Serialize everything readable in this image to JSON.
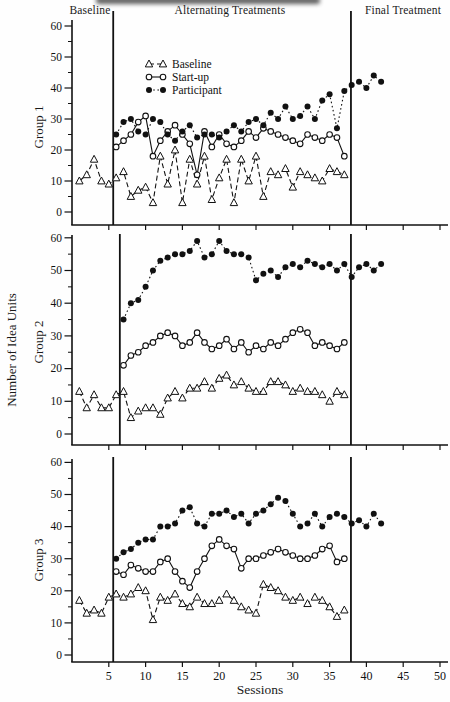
{
  "figure": {
    "phase_labels": {
      "baseline": "Baseline",
      "alternating": "Alternating Treatments",
      "final": "Final Treatment"
    },
    "ylabel": "Number of Idea Units",
    "xlabel": "Sessions",
    "legend": [
      {
        "key": "baseline",
        "label": "Baseline"
      },
      {
        "key": "startup",
        "label": "Start-up"
      },
      {
        "key": "participant",
        "label": "Participant"
      }
    ],
    "colors": {
      "ink": "#111111",
      "paper": "#fefefe"
    }
  },
  "chart_data": [
    {
      "type": "line",
      "title": "Group 1",
      "ylabel": "Group 1",
      "ylim": [
        0,
        60
      ],
      "yticks": [
        0,
        10,
        20,
        30,
        40,
        50,
        60
      ],
      "xlim": [
        0,
        50
      ],
      "xticks": [
        5,
        10,
        15,
        20,
        25,
        30,
        35,
        40,
        45,
        50
      ],
      "grid": false,
      "legend_position": "upper-left-inside",
      "phase_lines": [
        5.6,
        37.9
      ],
      "series": [
        {
          "name": "Baseline",
          "key": "baseline",
          "marker": "open-triangle",
          "line": "dashed",
          "start_session": 1,
          "values": [
            10,
            12,
            17,
            10,
            9,
            11,
            13,
            5,
            7,
            8,
            3,
            18,
            9,
            20,
            3,
            17,
            9,
            18,
            4,
            11,
            17,
            3,
            17,
            10,
            18,
            5,
            13,
            12,
            14,
            8,
            13,
            12,
            11,
            10,
            14,
            13,
            12
          ]
        },
        {
          "name": "Start-up",
          "key": "startup",
          "marker": "open-circle",
          "line": "solid",
          "start_session": 6,
          "values": [
            21,
            23,
            25,
            29,
            31,
            18,
            23,
            26,
            28,
            25,
            22,
            12,
            26,
            21,
            25,
            22,
            21,
            23,
            26,
            24,
            27,
            26,
            25,
            24,
            23,
            22,
            25,
            24,
            23,
            25,
            24,
            18
          ]
        },
        {
          "name": "Participant",
          "key": "participant",
          "marker": "filled-circle",
          "line": "dotted",
          "start_session": 6,
          "values": [
            25,
            29,
            30,
            26,
            25,
            30,
            29,
            25,
            23,
            26,
            28,
            24,
            25,
            25,
            24,
            26,
            28,
            26,
            29,
            30,
            28,
            32,
            30,
            34,
            30,
            31,
            34,
            30,
            36,
            38,
            27,
            39,
            41,
            42,
            40,
            44,
            42
          ]
        }
      ]
    },
    {
      "type": "line",
      "title": "Group 2",
      "ylabel": "Group 2",
      "ylim": [
        0,
        60
      ],
      "yticks": [
        0,
        10,
        20,
        30,
        40,
        50,
        60
      ],
      "xlim": [
        0,
        50
      ],
      "xticks": [
        5,
        10,
        15,
        20,
        25,
        30,
        35,
        40,
        45,
        50
      ],
      "grid": false,
      "phase_lines": [
        6.5,
        37.9
      ],
      "series": [
        {
          "name": "Baseline",
          "key": "baseline",
          "marker": "open-triangle",
          "line": "dashed",
          "start_session": 1,
          "values": [
            13,
            8,
            12,
            8,
            8,
            12,
            13,
            5,
            7,
            8,
            8,
            6,
            11,
            13,
            11,
            14,
            14,
            16,
            14,
            17,
            18,
            15,
            16,
            14,
            13,
            13,
            16,
            16,
            15,
            13,
            14,
            13,
            13,
            12,
            10,
            13,
            12
          ]
        },
        {
          "name": "Start-up",
          "key": "startup",
          "marker": "open-circle",
          "line": "solid",
          "start_session": 7,
          "values": [
            21,
            24,
            25,
            27,
            28,
            30,
            31,
            30,
            27,
            28,
            31,
            28,
            26,
            27,
            29,
            26,
            28,
            25,
            27,
            26,
            28,
            27,
            29,
            31,
            32,
            31,
            27,
            28,
            27,
            26,
            28
          ]
        },
        {
          "name": "Participant",
          "key": "participant",
          "marker": "filled-circle",
          "line": "dotted",
          "start_session": 7,
          "values": [
            35,
            40,
            41,
            45,
            50,
            53,
            54,
            55,
            55,
            56,
            59,
            54,
            55,
            59,
            56,
            55,
            55,
            54,
            47,
            49,
            50,
            48,
            51,
            52,
            51,
            53,
            52,
            51,
            52,
            50,
            52,
            48,
            51,
            52,
            50,
            52
          ]
        }
      ]
    },
    {
      "type": "line",
      "title": "Group 3",
      "ylabel": "Group 3",
      "xlabel": "Sessions",
      "ylim": [
        0,
        60
      ],
      "yticks": [
        0,
        10,
        20,
        30,
        40,
        50,
        60
      ],
      "xlim": [
        0,
        50
      ],
      "xticks": [
        5,
        10,
        15,
        20,
        25,
        30,
        35,
        40,
        45,
        50
      ],
      "grid": false,
      "phase_lines": [
        5.6,
        37.9
      ],
      "series": [
        {
          "name": "Baseline",
          "key": "baseline",
          "marker": "open-triangle",
          "line": "dashed",
          "start_session": 1,
          "values": [
            17,
            13,
            14,
            13,
            18,
            19,
            18,
            19,
            21,
            20,
            11,
            18,
            17,
            19,
            16,
            15,
            18,
            16,
            16,
            17,
            19,
            17,
            15,
            14,
            13,
            22,
            21,
            20,
            18,
            17,
            18,
            16,
            18,
            17,
            15,
            12,
            14
          ]
        },
        {
          "name": "Start-up",
          "key": "startup",
          "marker": "open-circle",
          "line": "solid",
          "start_session": 6,
          "values": [
            26,
            25,
            28,
            27,
            26,
            26,
            29,
            30,
            26,
            23,
            21,
            26,
            30,
            34,
            36,
            34,
            33,
            27,
            30,
            30,
            31,
            32,
            33,
            32,
            31,
            30,
            30,
            31,
            33,
            34,
            29,
            30
          ]
        },
        {
          "name": "Participant",
          "key": "participant",
          "marker": "filled-circle",
          "line": "dotted",
          "start_session": 6,
          "values": [
            30,
            32,
            33,
            35,
            36,
            36,
            40,
            40,
            41,
            45,
            46,
            41,
            40,
            44,
            44,
            45,
            43,
            44,
            41,
            44,
            45,
            47,
            49,
            48,
            44,
            40,
            41,
            44,
            40,
            43,
            44,
            43,
            41,
            42,
            40,
            44,
            41
          ]
        }
      ]
    }
  ]
}
